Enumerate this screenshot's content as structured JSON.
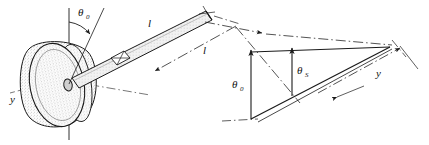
{
  "figure": {
    "background_color": "#ffffff",
    "line_color": "#1a1a1a",
    "disk_fill_color": "#d9d9d9",
    "rod_fill_color": "#e0e0e0",
    "width": 429,
    "height": 145
  },
  "labels": {
    "theta0_disk": {
      "symbol": "θ",
      "subscript": "0",
      "name": "theta-zero-disk-angle"
    },
    "rod_length_upper": {
      "symbol": "l",
      "name": "rod-length-label"
    },
    "rod_length_dimension": {
      "symbol": "l",
      "name": "rod-length-dimension-label"
    },
    "theta0_triangle": {
      "symbol": "θ",
      "subscript": "0",
      "name": "theta-zero-vector"
    },
    "theta_s_triangle": {
      "symbol": "θ",
      "subscript": "S",
      "name": "theta-s-vector"
    },
    "y_axis": {
      "symbol": "y",
      "name": "y-axis-label"
    },
    "y_dimension": {
      "symbol": "y",
      "name": "y-dimension-label"
    }
  },
  "elements": {
    "disk": "stippled-disk",
    "hub": "disk-hub",
    "rod": "hatched-rod",
    "section_marker": "rod-cross-section-marker",
    "vertical_axis": "disk-vertical-axis",
    "horizontal_axis": "disk-horizontal-axis",
    "angle_arc": "theta-zero-arc",
    "triangle": "vector-triangle",
    "dimension_lines": "dash-dot-dimension-lines"
  }
}
